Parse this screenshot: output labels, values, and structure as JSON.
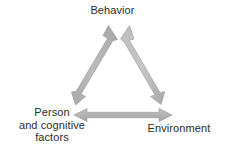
{
  "figure": {
    "title_text": "",
    "background_color": "#ffffff",
    "arrow_color": "#b3b3b3",
    "arrow_edge_color": "#9a9a9a",
    "text_color": "#2b2b2b"
  },
  "nodes": {
    "behavior": {
      "label": "Behavior"
    },
    "person": {
      "line1": "Person",
      "line2": "and cognitive",
      "line3": "factors"
    },
    "environment": {
      "label": "Environment"
    }
  },
  "connectors": [
    {
      "id": "person-behavior",
      "name": "left-diagonal-arrow",
      "from": "Person and cognitive factors",
      "to": "Behavior",
      "direction": "bidirectional"
    },
    {
      "id": "behavior-environment",
      "name": "right-diagonal-arrow",
      "from": "Behavior",
      "to": "Environment",
      "direction": "bidirectional"
    },
    {
      "id": "person-environment",
      "name": "bottom-horizontal-arrow",
      "from": "Person and cognitive factors",
      "to": "Environment",
      "direction": "bidirectional"
    }
  ]
}
